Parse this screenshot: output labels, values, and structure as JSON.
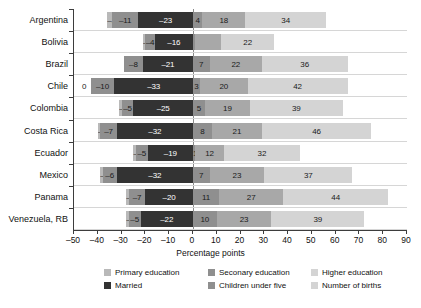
{
  "chart_data": {
    "type": "bar",
    "title": "",
    "xlabel": "Percentage points",
    "ylabel": "",
    "orientation": "horizontal",
    "stacked": true,
    "diverging": true,
    "grid": false,
    "xlim": [
      -50,
      90
    ],
    "xticks": [
      -50,
      -40,
      -30,
      -20,
      -10,
      0,
      10,
      20,
      30,
      40,
      50,
      60,
      70,
      80,
      90
    ],
    "xtick_labels": [
      "–50",
      "–40",
      "–30",
      "–20",
      "–10",
      "0",
      "10",
      "20",
      "30",
      "40",
      "50",
      "60",
      "70",
      "80",
      "90"
    ],
    "categories": [
      "Argentina",
      "Bolivia",
      "Brazil",
      "Chile",
      "Colombia",
      "Costa Rica",
      "Ecuador",
      "Mexico",
      "Panama",
      "Venezuela, RB"
    ],
    "legend_position": "bottom",
    "series": [
      {
        "name": "Primary education",
        "key": "primary",
        "color": "#b9b9b9",
        "side": "negative",
        "values": [
          -2,
          -1,
          0,
          0,
          -1,
          -1,
          -1,
          -1,
          -1,
          -1
        ]
      },
      {
        "name": "Seconary education",
        "key": "secondary",
        "color": "#8f8f8f",
        "side": "negative",
        "values": [
          -11,
          -4,
          -8,
          -10,
          -5,
          -7,
          -5,
          -6,
          -7,
          -5
        ]
      },
      {
        "name": "Married",
        "key": "married",
        "color": "#333333",
        "side": "negative",
        "values": [
          -23,
          -16,
          -21,
          -33,
          -25,
          -32,
          -19,
          -32,
          -20,
          -22
        ]
      },
      {
        "name": "Higher education",
        "key": "higher",
        "color": "#8f8f8f",
        "side": "positive",
        "values": [
          4,
          1,
          7,
          3,
          5,
          8,
          1,
          7,
          11,
          10
        ]
      },
      {
        "name": "Children under five",
        "key": "children",
        "color": "#a8a8a8",
        "side": "positive",
        "values": [
          18,
          11,
          22,
          20,
          19,
          21,
          12,
          23,
          27,
          23
        ]
      },
      {
        "name": "Number of births",
        "key": "births",
        "color": "#d4d4d4",
        "side": "positive",
        "values": [
          34,
          22,
          36,
          42,
          39,
          46,
          32,
          37,
          44,
          39
        ]
      }
    ],
    "value_labels": {
      "Argentina": {
        "primary": "–2",
        "secondary": "–11",
        "married": "–23",
        "higher": "4",
        "children": "18",
        "births": "34"
      },
      "Bolivia": {
        "primary": "–1",
        "secondary": "–4",
        "married": "–16",
        "higher": "",
        "children": "",
        "births": "22"
      },
      "Brazil": {
        "primary": "",
        "secondary": "–8",
        "married": "–21",
        "higher": "7",
        "children": "22",
        "births": "36"
      },
      "Chile": {
        "primary": "0",
        "secondary": "–10",
        "married": "–33",
        "higher": "3",
        "children": "20",
        "births": "42"
      },
      "Colombia": {
        "primary": "–1",
        "secondary": "–5",
        "married": "–25",
        "higher": "5",
        "children": "19",
        "births": "39"
      },
      "Costa Rica": {
        "primary": "–1",
        "secondary": "–7",
        "married": "–32",
        "higher": "8",
        "children": "21",
        "births": "46"
      },
      "Ecuador": {
        "primary": "–1",
        "secondary": "–5",
        "married": "–19",
        "higher": "1",
        "children": "12",
        "births": "32"
      },
      "Mexico": {
        "primary": "–1",
        "secondary": "–6",
        "married": "–32",
        "higher": "7",
        "children": "23",
        "births": "37"
      },
      "Panama": {
        "primary": "–1",
        "secondary": "–7",
        "married": "–20",
        "higher": "11",
        "children": "27",
        "births": "44"
      },
      "Venezuela, RB": {
        "primary": "–1",
        "secondary": "–5",
        "married": "–22",
        "higher": "10",
        "children": "23",
        "births": "39"
      }
    },
    "legend_entries": [
      {
        "label": "Primary education",
        "color": "#b9b9b9"
      },
      {
        "label": "Seconary education",
        "color": "#8f8f8f"
      },
      {
        "label": "Higher education",
        "color": "#d4d4d4"
      },
      {
        "label": "Married",
        "color": "#333333"
      },
      {
        "label": "Children under five",
        "color": "#8f8f8f"
      },
      {
        "label": "Number of births",
        "color": "#d4d4d4"
      }
    ]
  }
}
